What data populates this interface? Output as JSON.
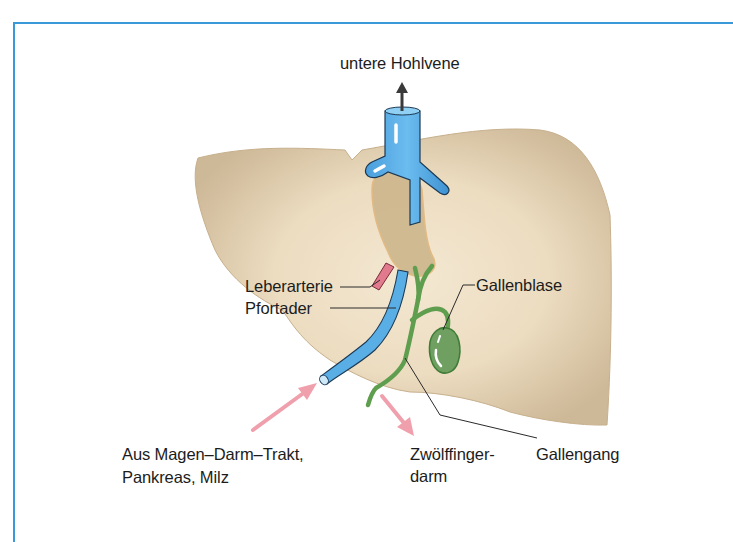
{
  "diagram": {
    "colors": {
      "frame": "#3a9ad9",
      "liver": "#d6c4a4",
      "liver_highlight": "#f3e6cf",
      "vein": "#5aaee6",
      "artery": "#e07a8c",
      "bile": "#5e9e4e",
      "flow_arrow": "#f0a0ac",
      "label_text": "#1c1c1c"
    },
    "labels": {
      "vena_cava": "untere Hohlvene",
      "hepatic_artery": "Leberarterie",
      "portal_vein": "Pfortader",
      "gallbladder": "Gallenblase",
      "inflow_line1": "Aus Magen–Darm–Trakt,",
      "inflow_line2": "Pankreas, Milz",
      "duodenum_line1": "Zwölffinger-",
      "duodenum_line2": "darm",
      "bile_duct": "Gallengang"
    }
  }
}
